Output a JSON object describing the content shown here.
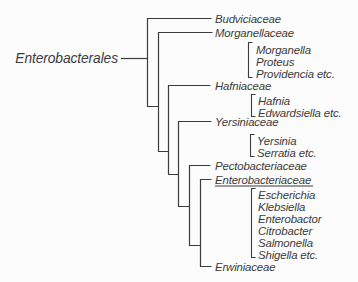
{
  "diagram": {
    "type": "phylogenetic-tree",
    "root_label": "Enterobacterales",
    "families": [
      {
        "name": "Budviciaceae",
        "underlined": false,
        "genera": []
      },
      {
        "name": "Morganellaceae",
        "underlined": false,
        "genera": [
          "Morganella",
          "Proteus",
          "Providencia etc."
        ]
      },
      {
        "name": "Hafniaceae",
        "underlined": false,
        "genera": [
          "Hafnia",
          "Edwardsiella etc."
        ]
      },
      {
        "name": "Yersiniaceae",
        "underlined": false,
        "genera": [
          "Yersinia",
          "Serratia etc."
        ]
      },
      {
        "name": "Pectobacteriaceae",
        "underlined": false,
        "genera": []
      },
      {
        "name": "Enterobacteriaceae",
        "underlined": true,
        "genera": [
          "Escherichia",
          "Klebsiella",
          "Enterobactor",
          "Citrobacter",
          "Salmonella",
          "Shigella etc."
        ]
      },
      {
        "name": "Erwiniaceae",
        "underlined": false,
        "genera": []
      }
    ],
    "colors": {
      "line": "#3c3c3c",
      "text": "#3b3b3b",
      "background": "#fcfcfc"
    }
  }
}
